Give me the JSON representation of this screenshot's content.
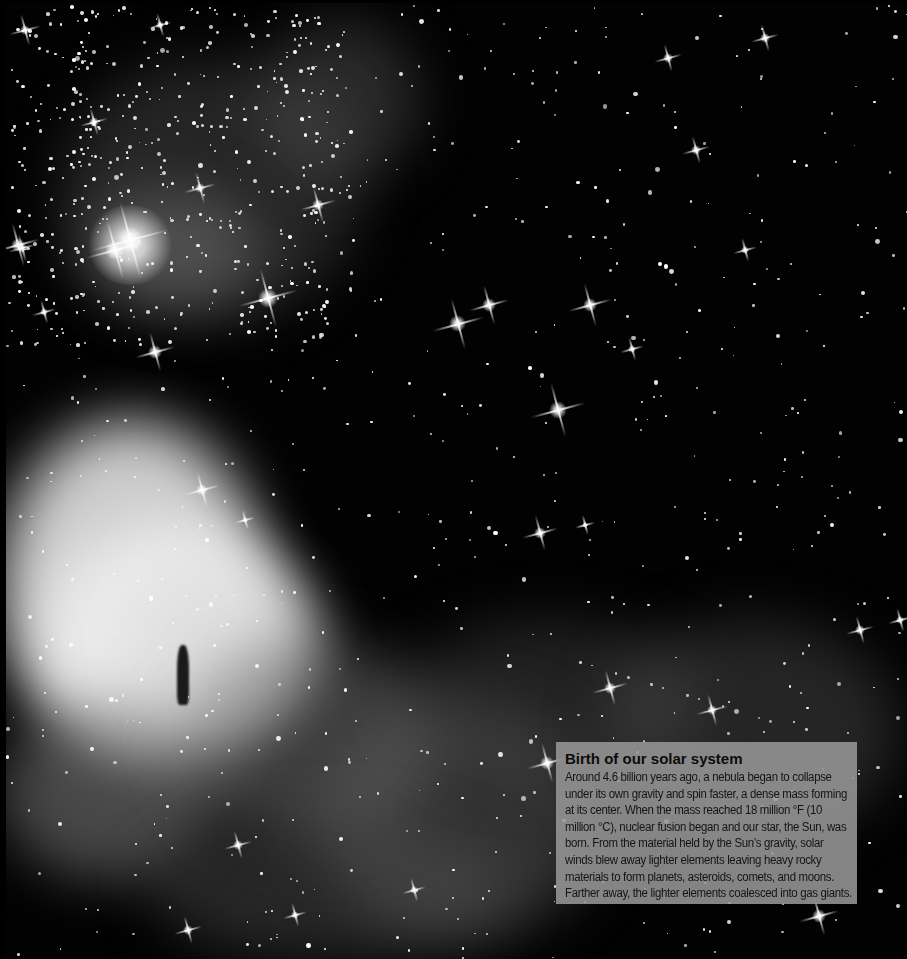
{
  "image": {
    "subject": "nebula-star-field",
    "palette": {
      "background": "#020202",
      "nebula": "#bdbdbd",
      "caption_bg": "#969696",
      "caption_text": "#111111"
    }
  },
  "caption": {
    "title": "Birth of our solar system",
    "body": "Around 4.6 billion years ago, a nebula began to collapse under its own gravity and spin faster, a dense mass forming at its center. When the mass reached 18 million °F (10 million °C), nuclear fusion began and our star, the Sun, was born. From the material held by the Sun’s gravity, solar winds blew away lighter elements leaving heavy rocky materials to form planets, asteroids, comets, and moons. Farther away, the lighter elements coalesced into gas giants."
  }
}
